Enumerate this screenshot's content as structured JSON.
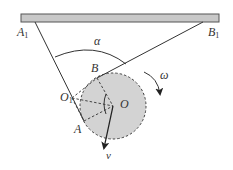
{
  "diagram": {
    "labels": {
      "A1": "A",
      "A1_sub": "1",
      "B1": "B",
      "B1_sub": "1",
      "alpha": "α",
      "B": "B",
      "omega": "ω",
      "O1": "O",
      "O1_sub": "1",
      "O": "O",
      "A": "A",
      "v": "v"
    },
    "colors": {
      "ceiling_fill": "#c8c8c8",
      "ceiling_stroke": "#555555",
      "disk_fill": "#d3d3d3",
      "line": "#333333"
    }
  }
}
